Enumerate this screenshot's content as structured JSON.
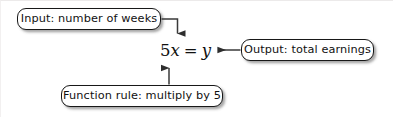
{
  "figure": {
    "background_color": "#ffffff",
    "line_color": "#3a3a3a",
    "box_border_color": "#181818",
    "text_color": "#111111"
  },
  "equation": {
    "coefficient": "5",
    "input_variable": "x",
    "operator": "=",
    "output_variable": "y",
    "full_text": "5x = y"
  },
  "callouts": [
    {
      "id": "input",
      "label": "Input: number of weeks",
      "points_to": "input-variable",
      "arrow": "elbow-down"
    },
    {
      "id": "output",
      "label": "Output: total earnings",
      "points_to": "output-variable",
      "arrow": "left"
    },
    {
      "id": "rule",
      "label": "Function rule: multiply by 5",
      "points_to": "coefficient",
      "arrow": "up"
    }
  ]
}
